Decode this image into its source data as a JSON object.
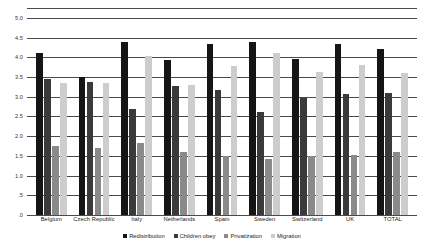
{
  "chart_data": {
    "type": "bar",
    "title": "",
    "xlabel": "",
    "ylabel": "",
    "ylim": [
      0,
      5.25
    ],
    "yticks": [
      0,
      0.5,
      1.0,
      1.5,
      2.0,
      2.5,
      3.0,
      3.5,
      4.0,
      4.5,
      5.0
    ],
    "ytick_labels": [
      ".0",
      ".5",
      "1.0",
      "1.5",
      "2.0",
      "2.5",
      "3.0",
      "3.5",
      "4.0",
      "4.5",
      "5.0"
    ],
    "grid": true,
    "legend_position": "bottom",
    "categories": [
      "Belgium",
      "Czech Republic",
      "Italy",
      "Netherlands",
      "Spain",
      "Sweden",
      "Switzerland",
      "UK",
      "TOTAL"
    ],
    "series": [
      {
        "name": "Redistribution",
        "color": "#151515",
        "values": [
          4.1,
          3.5,
          4.4,
          3.93,
          4.35,
          4.4,
          3.95,
          4.35,
          4.2
        ]
      },
      {
        "name": "Children obey",
        "color": "#3a3a3a",
        "values": [
          3.44,
          3.38,
          2.68,
          3.28,
          3.18,
          2.62,
          2.97,
          3.08,
          3.1
        ]
      },
      {
        "name": "Privatization",
        "color": "#8a8a8a",
        "values": [
          1.76,
          1.7,
          1.82,
          1.6,
          1.5,
          1.42,
          1.5,
          1.52,
          1.6
        ]
      },
      {
        "name": "Migration",
        "color": "#cdcdcd",
        "values": [
          3.36,
          3.34,
          4.04,
          3.3,
          3.77,
          4.1,
          3.62,
          3.8,
          3.6
        ]
      }
    ]
  },
  "colors": {
    "gridline": "#4a4a4a",
    "axis_text": "#333333",
    "label_text": "#1a1a1a",
    "background": "#ffffff"
  }
}
